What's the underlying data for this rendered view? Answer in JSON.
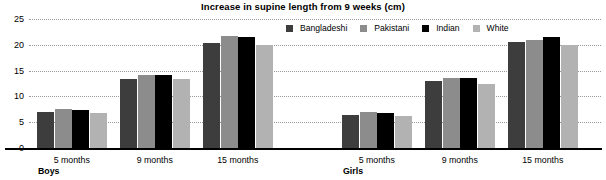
{
  "chart_data": {
    "type": "bar",
    "title": "Increase in supine length from 9 weeks (cm)",
    "xlabel": "",
    "ylabel": "",
    "ylim": [
      0,
      25
    ],
    "yticks": [
      0,
      5,
      10,
      15,
      20,
      25
    ],
    "grid": true,
    "legend_position": "top-right",
    "categories": [
      "5 months",
      "9 months",
      "15 months",
      "5 months",
      "9 months",
      "15 months"
    ],
    "groups": [
      {
        "name": "Boys",
        "categories": [
          "5 months",
          "9 months",
          "15 months"
        ]
      },
      {
        "name": "Girls",
        "categories": [
          "5 months",
          "9 months",
          "15 months"
        ]
      }
    ],
    "series": [
      {
        "name": "Bangladeshi",
        "color": "#3d3d3d",
        "values": [
          7.0,
          13.3,
          20.3,
          6.4,
          12.9,
          20.6
        ]
      },
      {
        "name": "Pakistani",
        "color": "#8c8c8c",
        "values": [
          7.6,
          14.2,
          21.8,
          7.0,
          13.5,
          21.0
        ]
      },
      {
        "name": "Indian",
        "color": "#000000",
        "values": [
          7.3,
          14.2,
          21.5,
          6.7,
          13.5,
          21.5
        ]
      },
      {
        "name": "White",
        "color": "#b2b2b2",
        "values": [
          6.8,
          13.4,
          20.0,
          6.3,
          12.5,
          19.9
        ]
      }
    ]
  },
  "legend": {
    "items": [
      {
        "label": "Bangladeshi",
        "color": "#3d3d3d"
      },
      {
        "label": "Pakistani",
        "color": "#8c8c8c"
      },
      {
        "label": "Indian",
        "color": "#000000"
      },
      {
        "label": "White",
        "color": "#b2b2b2"
      }
    ]
  },
  "yaxis": {
    "ticks": [
      "25",
      "20",
      "15",
      "10",
      "5",
      "0"
    ]
  },
  "xaxis": {
    "categories": [
      "5 months",
      "9 months",
      "15 months",
      "5 months",
      "9 months",
      "15 months"
    ],
    "group_labels": [
      "Boys",
      "Girls"
    ]
  },
  "colors": {
    "background": "#ffffff",
    "axis": "#000000",
    "gridline": "#9a9a9a"
  }
}
